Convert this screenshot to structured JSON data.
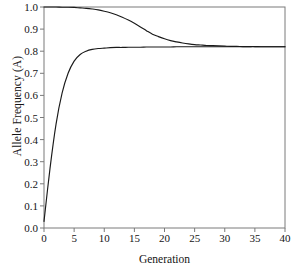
{
  "chart_data": {
    "type": "line",
    "title": "",
    "xlabel": "Generation",
    "ylabel": "Allele Frequency (A)",
    "xlim": [
      0,
      40
    ],
    "ylim": [
      0.0,
      1.0
    ],
    "grid": false,
    "legend": null,
    "xticks": [
      "0",
      "5",
      "10",
      "15",
      "20",
      "25",
      "30",
      "35",
      "40"
    ],
    "xtick_values": [
      0,
      5,
      10,
      15,
      20,
      25,
      30,
      35,
      40
    ],
    "yticks": [
      "0.0",
      "0.1",
      "0.2",
      "0.3",
      "0.4",
      "0.5",
      "0.6",
      "0.7",
      "0.8",
      "0.9",
      "1.0"
    ],
    "ytick_values": [
      0.0,
      0.1,
      0.2,
      0.3,
      0.4,
      0.5,
      0.6,
      0.7,
      0.8,
      0.9,
      1.0
    ],
    "line_color": "#1a1a1a",
    "frame_color": "#7a7a7a",
    "x": [
      0,
      1,
      2,
      3,
      4,
      5,
      6,
      7,
      8,
      9,
      10,
      11,
      12,
      13,
      14,
      15,
      16,
      17,
      18,
      19,
      20,
      21,
      22,
      23,
      24,
      25,
      26,
      27,
      28,
      29,
      30,
      31,
      32,
      33,
      34,
      35,
      36,
      37,
      38,
      39,
      40
    ],
    "series": [
      {
        "name": "Population starting at p = 1.0",
        "values": [
          1.0,
          1.0,
          1.0,
          0.999,
          0.999,
          0.998,
          0.996,
          0.994,
          0.991,
          0.987,
          0.981,
          0.974,
          0.965,
          0.954,
          0.941,
          0.926,
          0.91,
          0.893,
          0.877,
          0.866,
          0.856,
          0.848,
          0.842,
          0.837,
          0.833,
          0.83,
          0.828,
          0.826,
          0.825,
          0.824,
          0.823,
          0.822,
          0.822,
          0.821,
          0.821,
          0.821,
          0.82,
          0.82,
          0.82,
          0.82,
          0.82
        ]
      },
      {
        "name": "Population starting at p = 0.03",
        "values": [
          0.03,
          0.27,
          0.47,
          0.61,
          0.7,
          0.755,
          0.785,
          0.8,
          0.808,
          0.812,
          0.814,
          0.816,
          0.817,
          0.817,
          0.818,
          0.818,
          0.818,
          0.819,
          0.819,
          0.819,
          0.819,
          0.819,
          0.82,
          0.82,
          0.82,
          0.82,
          0.82,
          0.82,
          0.82,
          0.82,
          0.82,
          0.82,
          0.82,
          0.82,
          0.82,
          0.82,
          0.82,
          0.82,
          0.82,
          0.82,
          0.82
        ]
      }
    ]
  }
}
